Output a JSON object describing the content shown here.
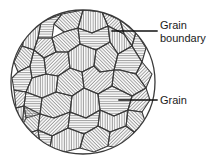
{
  "figure": {
    "background_color": "#ffffff",
    "outline_color": "#3a3a3a",
    "hatch_color": "#6e6e6e",
    "text_color": "#1a1a1a",
    "circle": {
      "cx": 83,
      "cy": 82,
      "r": 72
    }
  },
  "annotations": [
    {
      "id": "grain-boundary",
      "lines": [
        "Grain",
        "boundary"
      ],
      "line1": "Grain",
      "line2": "boundary",
      "leader": {
        "x1": 112,
        "y1": 31,
        "x2": 157,
        "y2": 31
      },
      "text_x": 160,
      "text_y": 29,
      "line_height": 13
    },
    {
      "id": "grain",
      "lines": [
        "Grain"
      ],
      "line1": "Grain",
      "line2": "",
      "leader": {
        "x1": 119,
        "y1": 100,
        "x2": 157,
        "y2": 100
      },
      "text_x": 160,
      "text_y": 104,
      "line_height": 13
    }
  ],
  "grains": [
    {
      "id": "g01",
      "points": "83,10 102,12 108,26 92,33 78,28",
      "angle": 90
    },
    {
      "id": "g02",
      "points": "62,14 83,10 78,28 64,32 54,24",
      "angle": 45
    },
    {
      "id": "g03",
      "points": "41,22 62,14 54,24 52,38 38,38",
      "angle": 0
    },
    {
      "id": "g04",
      "points": "102,12 120,20 124,34 108,26",
      "angle": 135
    },
    {
      "id": "g05",
      "points": "120,20 136,32 132,46 124,34",
      "angle": 45
    },
    {
      "id": "g06",
      "points": "26,34 41,22 38,38 34,50 22,46",
      "angle": 90
    },
    {
      "id": "g07",
      "points": "38,38 52,38 56,52 44,58 34,50",
      "angle": 135
    },
    {
      "id": "g08",
      "points": "52,38 64,32 78,28 80,44 68,52 56,52",
      "angle": 45
    },
    {
      "id": "g09",
      "points": "78,28 92,33 108,26 110,42 96,50 80,44",
      "angle": 0
    },
    {
      "id": "g10",
      "points": "108,26 124,34 132,46 118,54 110,42",
      "angle": 90
    },
    {
      "id": "g11",
      "points": "136,32 146,48 142,62 132,46",
      "angle": 0
    },
    {
      "id": "g12",
      "points": "14,62 22,46 34,50 30,66 18,72",
      "angle": 45
    },
    {
      "id": "g13",
      "points": "34,50 44,58 46,74 32,78 30,66",
      "angle": 0
    },
    {
      "id": "g14",
      "points": "44,58 56,52 68,52 70,68 58,76 46,74",
      "angle": 135
    },
    {
      "id": "g15",
      "points": "68,52 80,44 96,50 94,66 82,72 70,68",
      "angle": 90
    },
    {
      "id": "g16",
      "points": "96,50 110,42 118,54 114,70 100,72 94,66",
      "angle": 45
    },
    {
      "id": "g17",
      "points": "118,54 132,46 142,62 136,74 120,70 114,70",
      "angle": 0
    },
    {
      "id": "g18",
      "points": "142,62 152,74 146,88 136,74",
      "angle": 135
    },
    {
      "id": "g19",
      "points": "12,78 18,72 30,66 32,78 26,92 14,90",
      "angle": 0
    },
    {
      "id": "g20",
      "points": "32,78 46,74 58,76 56,92 42,98 26,92",
      "angle": 90
    },
    {
      "id": "g21",
      "points": "58,76 70,68 82,72 84,88 72,96 56,92",
      "angle": 45
    },
    {
      "id": "g22",
      "points": "82,72 94,66 100,72 114,70 112,86 98,94 84,88",
      "angle": 135
    },
    {
      "id": "g23",
      "points": "114,70 120,70 136,74 146,88 132,96 112,86",
      "angle": 45
    },
    {
      "id": "g24",
      "points": "14,90 26,92 24,106 16,108",
      "angle": 135
    },
    {
      "id": "g25",
      "points": "26,92 42,98 40,114 26,118 24,106",
      "angle": 0
    },
    {
      "id": "g26",
      "points": "42,98 56,92 72,96 70,112 54,118 40,114",
      "angle": 45
    },
    {
      "id": "g27",
      "points": "72,96 84,88 98,94 100,110 86,118 70,112",
      "angle": 90
    },
    {
      "id": "g28",
      "points": "98,94 112,86 132,96 128,110 114,116 100,110",
      "angle": 0
    },
    {
      "id": "g29",
      "points": "132,96 146,88 150,100 142,112 128,110",
      "angle": 135
    },
    {
      "id": "g30",
      "points": "16,108 24,106 26,118 22,126",
      "angle": 90
    },
    {
      "id": "g31",
      "points": "24,106 40,114 38,130 26,134 22,126",
      "angle": 45
    },
    {
      "id": "g32",
      "points": "40,114 54,118 70,112 68,128 52,136 38,130",
      "angle": 135
    },
    {
      "id": "g33",
      "points": "70,112 86,118 100,110 98,126 84,134 68,128",
      "angle": 0
    },
    {
      "id": "g34",
      "points": "100,110 114,116 128,110 126,126 110,132 98,126",
      "angle": 90
    },
    {
      "id": "g35",
      "points": "128,110 142,112 146,124 134,132 126,126",
      "angle": 45
    },
    {
      "id": "g36",
      "points": "38,130 52,136 50,148 40,144",
      "angle": 0
    },
    {
      "id": "g37",
      "points": "52,136 68,128 84,134 80,148 64,152 50,148",
      "angle": 90
    },
    {
      "id": "g38",
      "points": "84,134 98,126 110,132 108,146 94,152 80,148",
      "angle": 45
    },
    {
      "id": "g39",
      "points": "110,132 126,126 134,132 130,142 118,148 108,146",
      "angle": 135
    },
    {
      "id": "g40",
      "points": "26,134 38,130 40,144 32,142",
      "angle": 135
    }
  ]
}
